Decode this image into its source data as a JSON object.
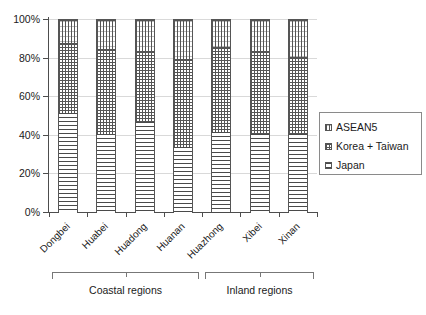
{
  "chart_data": {
    "type": "bar",
    "subtype": "100% stacked column",
    "title": "",
    "xlabel": "",
    "ylabel": "",
    "ylim": [
      0,
      100
    ],
    "ytick_labels": [
      "0%",
      "20%",
      "40%",
      "60%",
      "80%",
      "100%"
    ],
    "ytick_values": [
      0,
      20,
      40,
      60,
      80,
      100
    ],
    "grid": true,
    "legend_position": "right",
    "categories": [
      "Dongbei",
      "Huabei",
      "Huadong",
      "Huanan",
      "Huazhong",
      "Xibei",
      "Xinan"
    ],
    "series": [
      {
        "name": "Japan",
        "values": [
          52,
          41,
          47,
          34,
          42,
          41,
          41
        ]
      },
      {
        "name": "Korea + Taiwan",
        "values": [
          36,
          44,
          37,
          46,
          44,
          43,
          40
        ]
      },
      {
        "name": "ASEAN5",
        "values": [
          12,
          15,
          16,
          20,
          14,
          16,
          19
        ]
      }
    ],
    "stack_order_bottom_to_top": [
      "Japan",
      "Korea + Taiwan",
      "ASEAN5"
    ],
    "groups": [
      {
        "label": "Coastal regions",
        "categories": [
          "Dongbei",
          "Huabei",
          "Huadong",
          "Huanan"
        ]
      },
      {
        "label": "Inland regions",
        "categories": [
          "Huazhong",
          "Xibei",
          "Xinan"
        ]
      }
    ]
  },
  "legend": {
    "items": [
      {
        "label": "ASEAN5",
        "pattern": "vertical-line-hatch"
      },
      {
        "label": "Korea + Taiwan",
        "pattern": "cross-dot-hatch"
      },
      {
        "label": "Japan",
        "pattern": "horizontal-line-hatch"
      }
    ]
  },
  "axis": {
    "y_ticks": [
      "100%",
      "80%",
      "60%",
      "40%",
      "20%",
      "0%"
    ]
  }
}
